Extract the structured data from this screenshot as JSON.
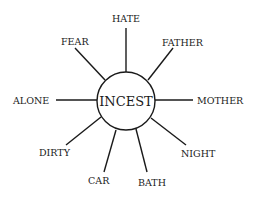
{
  "diagram": {
    "center": {
      "label": "INCEST"
    },
    "spokes": [
      {
        "label": "HATE"
      },
      {
        "label": "FATHER"
      },
      {
        "label": "MOTHER"
      },
      {
        "label": "NIGHT"
      },
      {
        "label": "BATH"
      },
      {
        "label": "CAR"
      },
      {
        "label": "DIRTY"
      },
      {
        "label": "ALONE"
      },
      {
        "label": "FEAR"
      }
    ]
  },
  "colors": {
    "ink": "#1a1a1a",
    "background": "#ffffff"
  }
}
